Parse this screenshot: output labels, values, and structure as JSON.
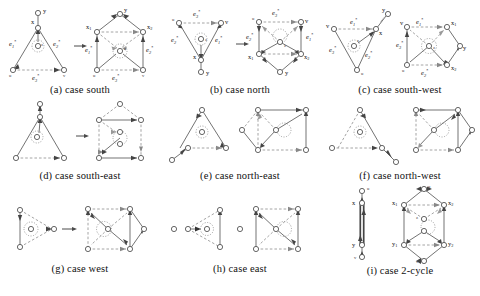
{
  "figure": {
    "type": "graph-transformation-case-diagrams",
    "panel_count": 9,
    "columns": 3,
    "rows": 3,
    "colors": {
      "background": "#ffffff",
      "node_stroke": "#555555",
      "solid_edge": "#5a5a5a",
      "dashed_edge": "#8e8e8e",
      "text": "#111111"
    },
    "edge_label_names": [
      "e1*",
      "e2*",
      "e3*"
    ],
    "node_label_names": [
      "x",
      "y",
      "z",
      "u",
      "v",
      "x1",
      "x2",
      "y1",
      "y2"
    ]
  },
  "panels": [
    {
      "id": "a",
      "caption": "(a)  case south",
      "caption_key": "case south",
      "left_labels": [
        "y",
        "x",
        "z",
        "e1*",
        "e2*",
        "e3*",
        "u",
        "v"
      ],
      "right_labels": [
        "y",
        "x1",
        "x2",
        "z",
        "e1*",
        "e2*",
        "e3*",
        "u",
        "v"
      ]
    },
    {
      "id": "b",
      "caption": "(b)  case north",
      "caption_key": "case north",
      "left_labels": [
        "u",
        "v",
        "z",
        "x",
        "y",
        "e1*",
        "e2*",
        "e3*"
      ],
      "right_labels": [
        "u",
        "v",
        "z",
        "x1",
        "x2",
        "y",
        "e1*",
        "e2*",
        "e3*"
      ]
    },
    {
      "id": "c",
      "caption": "(c)  case south-west",
      "caption_key": "case south-west",
      "left_labels": [
        "v",
        "y",
        "x",
        "z",
        "u",
        "e1*",
        "e2*",
        "e3*"
      ],
      "right_labels": [
        "v",
        "x1",
        "z",
        "y",
        "u",
        "x2",
        "e1*",
        "e2*",
        "e3*"
      ]
    },
    {
      "id": "d",
      "caption": "(d)  case south-east",
      "caption_key": "case south-east",
      "left_labels": [],
      "right_labels": []
    },
    {
      "id": "e",
      "caption": "(e)  case north-east",
      "caption_key": "case north-east",
      "left_labels": [],
      "right_labels": []
    },
    {
      "id": "f",
      "caption": "(f)  case north-west",
      "caption_key": "case north-west",
      "left_labels": [],
      "right_labels": []
    },
    {
      "id": "g",
      "caption": "(g)  case west",
      "caption_key": "case west",
      "left_labels": [],
      "right_labels": []
    },
    {
      "id": "h",
      "caption": "(h)  case east",
      "caption_key": "case east",
      "left_labels": [],
      "right_labels": []
    },
    {
      "id": "i",
      "caption": "(i)  case 2-cycle",
      "caption_key": "case 2-cycle",
      "left_labels": [
        "u",
        "x",
        "y",
        "v"
      ],
      "right_labels": [
        "u",
        "x1",
        "x2",
        "z",
        "y1",
        "y2",
        "v"
      ]
    }
  ]
}
